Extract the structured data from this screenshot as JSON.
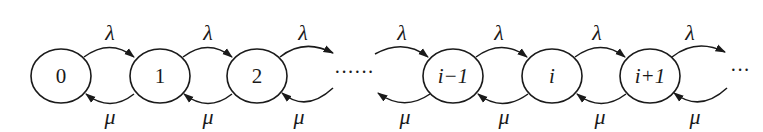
{
  "diagram": {
    "type": "birth-death-markov-chain",
    "states": [
      {
        "label": "0",
        "cx": 61,
        "italic": false
      },
      {
        "label": "1",
        "cx": 160,
        "italic": false
      },
      {
        "label": "2",
        "cx": 257,
        "italic": false
      },
      {
        "label": "i−1",
        "cx": 453,
        "italic": true
      },
      {
        "label": "i",
        "cx": 552,
        "italic": true
      },
      {
        "label": "i+1",
        "cx": 650,
        "italic": true
      }
    ],
    "forward_rate": "λ",
    "backward_rate": "μ",
    "rate_labels": {
      "lambda": [
        "λ",
        "λ",
        "λ",
        "λ",
        "λ",
        "λ",
        "λ"
      ],
      "mu": [
        "μ",
        "μ",
        "μ",
        "μ",
        "μ",
        "μ",
        "μ"
      ]
    },
    "middle_ellipsis": "······",
    "end_ellipsis": "···"
  }
}
